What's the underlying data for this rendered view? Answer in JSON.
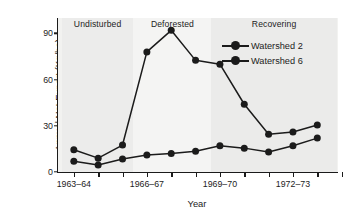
{
  "chart_data": {
    "type": "line",
    "title": "",
    "xlabel": "Year",
    "ylabel": "Annual Net Export (Kg/ha)",
    "ylim": [
      0,
      100
    ],
    "yticks": [
      0,
      30,
      60,
      90
    ],
    "ytick_labels": [
      "0",
      "30",
      "60",
      "90"
    ],
    "grid": false,
    "legend_position": "top-right",
    "x": [
      1,
      2,
      3,
      4,
      5,
      6,
      7,
      8,
      9,
      10,
      11
    ],
    "xtick_positions": [
      1,
      4,
      7,
      10
    ],
    "xtick_labels": [
      "1963–64",
      "1966–67",
      "1969–70",
      "1972–73"
    ],
    "x_tick_count": 12,
    "series": [
      {
        "name": "Watershed 2",
        "color": "#1b1b1b",
        "values": [
          7,
          4.5,
          8.5,
          11,
          12,
          13.5,
          17,
          15.5,
          13,
          17,
          22
        ]
      },
      {
        "name": "Watershed 6",
        "color": "#1b1b1b",
        "values": [
          14.5,
          9,
          17.5,
          78,
          92,
          72.5,
          70,
          44,
          24.5,
          26,
          30.5
        ]
      }
    ],
    "annotations": [
      {
        "label": "Undisturbed",
        "x_start": 0.5,
        "x_end": 3.45
      },
      {
        "label": "Deforested",
        "x_start": 3.45,
        "x_end": 6.65
      },
      {
        "label": "Recovering",
        "x_start": 6.65,
        "x_end": 11.8
      }
    ]
  },
  "legend": {
    "items": [
      {
        "label": "Watershed 2"
      },
      {
        "label": "Watershed 6"
      }
    ]
  },
  "credit": {
    "text": "© Cengage Learning"
  },
  "colors": {
    "ink": "#1b1b1b",
    "plot_background": "#f2f2f0",
    "band_undisturbed": "#ececeb",
    "band_deforested": "#f4f4f3",
    "band_recovering": "#ebebea"
  }
}
